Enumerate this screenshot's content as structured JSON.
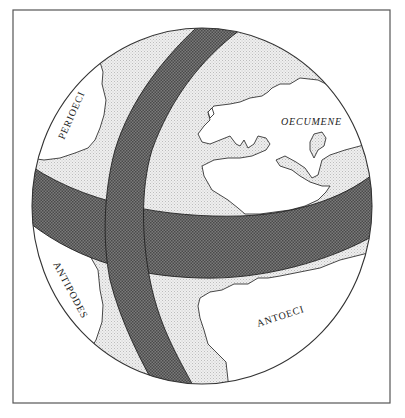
{
  "figure": {
    "labels": {
      "perioeci": "PERIOECI",
      "oecumene": "OECUMENE",
      "antipodes": "ANTIPODES",
      "antoeci": "ANTOECI"
    },
    "colors": {
      "background": "#ffffff",
      "land": "#ffffff",
      "sea_stipple": "#d9d9d9",
      "ocean_belt": "#6b6b6b",
      "outline": "#333333"
    }
  }
}
